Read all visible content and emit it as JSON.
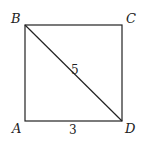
{
  "diagram": {
    "type": "square-with-diagonal",
    "vertices": {
      "A": {
        "label": "A",
        "x": 25,
        "y": 121
      },
      "B": {
        "label": "B",
        "x": 25,
        "y": 25
      },
      "C": {
        "label": "C",
        "x": 122,
        "y": 25
      },
      "D": {
        "label": "D",
        "x": 122,
        "y": 121
      }
    },
    "edges": [
      "AB",
      "BC",
      "CD",
      "DA",
      "BD"
    ],
    "measurements": {
      "diagonal_BD": "5",
      "side_AD": "3"
    },
    "stroke_color": "#222222"
  }
}
